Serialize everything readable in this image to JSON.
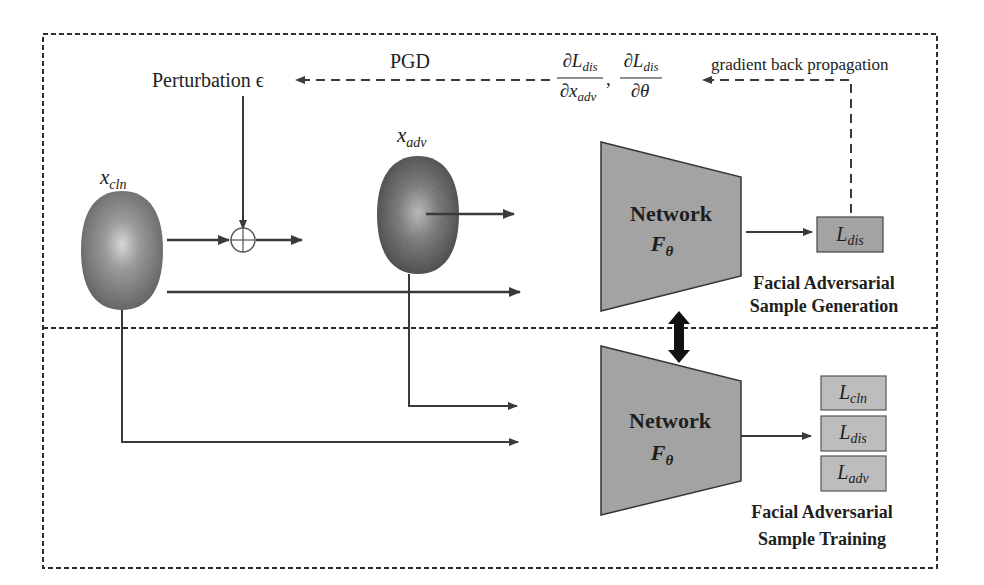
{
  "diagram": {
    "type": "adversarial-training-pipeline",
    "colors": {
      "line": "#3a3a3a",
      "network_fill": "#a3a3a3",
      "loss_fill": "#bdbdbd",
      "face_fill": "#8a8a8a",
      "background": "#ffffff"
    },
    "labels": {
      "perturbation": "Perturbation ϵ",
      "pgd": "PGD",
      "gradient_back_propagation": "gradient back propagation",
      "x_cln": {
        "base": "x",
        "sub": "cln"
      },
      "x_adv": {
        "base": "x",
        "sub": "adv"
      },
      "grad_numerator_1": {
        "base": "∂L",
        "sub": "dis"
      },
      "grad_denominator_1": {
        "base": "∂x",
        "sub": "adv"
      },
      "grad_numerator_2": {
        "base": "∂L",
        "sub": "dis"
      },
      "grad_denominator_2": "∂θ"
    },
    "top_section": {
      "title_line1": "Facial Adversarial",
      "title_line2": "Sample Generation",
      "network": {
        "name": "Network",
        "param": {
          "base": "F",
          "sub": "θ"
        }
      },
      "loss": {
        "base": "L",
        "sub": "dis"
      }
    },
    "bottom_section": {
      "title_line1": "Facial Adversarial",
      "title_line2": "Sample Training",
      "network": {
        "name": "Network",
        "param": {
          "base": "F",
          "sub": "θ"
        }
      },
      "losses": [
        {
          "base": "L",
          "sub": "cln"
        },
        {
          "base": "L",
          "sub": "dis"
        },
        {
          "base": "L",
          "sub": "adv"
        }
      ]
    },
    "operator": "⊕"
  }
}
